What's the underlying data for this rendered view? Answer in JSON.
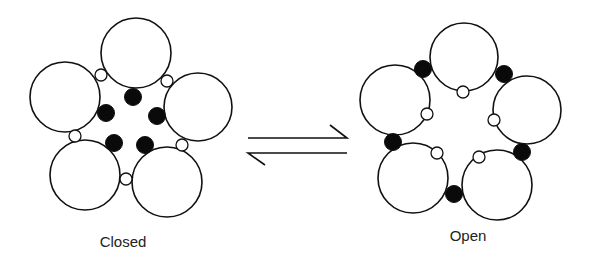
{
  "diagram": {
    "type": "channel-conformation-equilibrium",
    "colors": {
      "stroke": "#111111",
      "fill_large": "#ffffff",
      "fill_dark": "#0a0a0a",
      "background": "#ffffff"
    },
    "states": [
      {
        "id": "closed",
        "label": "Closed",
        "label_pos": [
          123,
          247
        ],
        "subunits": [
          {
            "cx": 136,
            "cy": 53,
            "r": 35
          },
          {
            "cx": 65,
            "cy": 97,
            "r": 35
          },
          {
            "cx": 198,
            "cy": 107,
            "r": 34
          },
          {
            "cx": 85,
            "cy": 175,
            "r": 35
          },
          {
            "cx": 167,
            "cy": 182,
            "r": 35
          }
        ],
        "open_sites": [
          {
            "cx": 101,
            "cy": 75,
            "r": 6
          },
          {
            "cx": 167,
            "cy": 81,
            "r": 6
          },
          {
            "cx": 75,
            "cy": 136,
            "r": 6
          },
          {
            "cx": 182,
            "cy": 145,
            "r": 6
          },
          {
            "cx": 126,
            "cy": 179,
            "r": 6
          }
        ],
        "filled_sites": [
          {
            "cx": 133,
            "cy": 97,
            "r": 8.5
          },
          {
            "cx": 106,
            "cy": 113,
            "r": 8.5
          },
          {
            "cx": 157,
            "cy": 116,
            "r": 8.5
          },
          {
            "cx": 114,
            "cy": 143,
            "r": 8.5
          },
          {
            "cx": 145,
            "cy": 145,
            "r": 8.5
          }
        ]
      },
      {
        "id": "open",
        "label": "Open",
        "label_pos": [
          468,
          241
        ],
        "subunits": [
          {
            "cx": 464,
            "cy": 57,
            "r": 34
          },
          {
            "cx": 395,
            "cy": 100,
            "r": 35
          },
          {
            "cx": 527,
            "cy": 110,
            "r": 34
          },
          {
            "cx": 413,
            "cy": 178,
            "r": 35
          },
          {
            "cx": 497,
            "cy": 185,
            "r": 35
          }
        ],
        "open_sites": [
          {
            "cx": 463,
            "cy": 92,
            "r": 6
          },
          {
            "cx": 427,
            "cy": 114,
            "r": 6
          },
          {
            "cx": 494,
            "cy": 120,
            "r": 6
          },
          {
            "cx": 437,
            "cy": 153,
            "r": 6
          },
          {
            "cx": 479,
            "cy": 157,
            "r": 6
          }
        ],
        "filled_sites": [
          {
            "cx": 423,
            "cy": 69,
            "r": 8.5
          },
          {
            "cx": 504,
            "cy": 74,
            "r": 8.5
          },
          {
            "cx": 393,
            "cy": 142,
            "r": 8.5
          },
          {
            "cx": 522,
            "cy": 152,
            "r": 8.5
          },
          {
            "cx": 454,
            "cy": 194,
            "r": 8.5
          }
        ]
      }
    ],
    "equilibrium_arrow": {
      "forward": {
        "x1": 248,
        "y1": 138,
        "x2": 347,
        "y2": 138,
        "barb": [
          330,
          125
        ]
      },
      "reverse": {
        "x1": 347,
        "y1": 153,
        "x2": 248,
        "y2": 153,
        "barb": [
          265,
          165
        ]
      }
    }
  }
}
